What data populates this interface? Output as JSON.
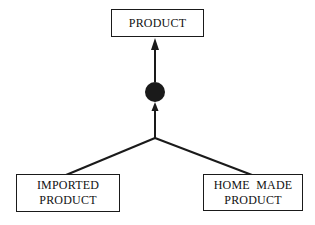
{
  "diagram": {
    "type": "generalization-hierarchy",
    "nodes": [
      {
        "id": "product",
        "lines": [
          "PRODUCT"
        ]
      },
      {
        "id": "imported",
        "lines": [
          "IMPORTED",
          "PRODUCT"
        ]
      },
      {
        "id": "homemade",
        "lines": [
          "HOME  MADE",
          "PRODUCT"
        ]
      }
    ],
    "edges": [
      {
        "from": "imported",
        "to": "product",
        "via": "generalization-junction"
      },
      {
        "from": "homemade",
        "to": "product",
        "via": "generalization-junction"
      }
    ],
    "junction_symbol": "filled-circle",
    "colors": {
      "line": "#1a1a1a",
      "background": "#ffffff"
    }
  }
}
